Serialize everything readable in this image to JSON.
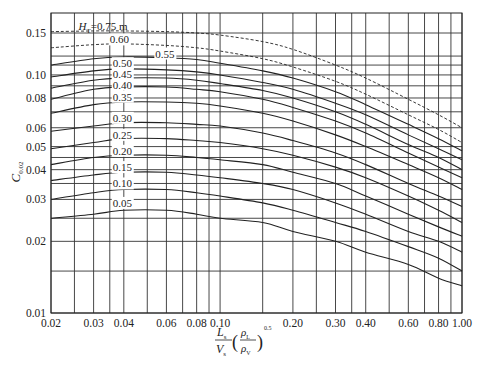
{
  "chart_data": {
    "type": "line",
    "title": "",
    "xlabel": "L_s/V_s (ρ_L/ρ_V)^0.5",
    "ylabel": "C_0.02",
    "xscale": "log",
    "yscale": "log",
    "xlim": [
      0.02,
      1.0
    ],
    "ylim": [
      0.01,
      0.18
    ],
    "grid": true,
    "x_tick_labels": [
      "0.02",
      "0.03",
      "0.04",
      "0.06",
      "0.08",
      "0.10",
      "0.20",
      "0.30",
      "0.40",
      "0.60",
      "0.80",
      "1.00"
    ],
    "x_ticks": [
      0.02,
      0.03,
      0.04,
      0.06,
      0.08,
      0.1,
      0.2,
      0.3,
      0.4,
      0.6,
      0.8,
      1.0
    ],
    "y_tick_labels": [
      "0.01",
      "0.02",
      "0.03",
      "0.04",
      "0.05",
      "0.06",
      "0.08",
      "0.10",
      "0.15"
    ],
    "y_ticks": [
      0.01,
      0.02,
      0.03,
      0.04,
      0.05,
      0.06,
      0.08,
      0.1,
      0.15
    ],
    "x_grid": [
      0.02,
      0.025,
      0.03,
      0.035,
      0.04,
      0.05,
      0.06,
      0.07,
      0.08,
      0.09,
      0.1,
      0.15,
      0.2,
      0.25,
      0.3,
      0.35,
      0.4,
      0.5,
      0.6,
      0.7,
      0.8,
      0.9,
      1.0
    ],
    "y_grid": [
      0.01,
      0.015,
      0.02,
      0.025,
      0.03,
      0.035,
      0.04,
      0.045,
      0.05,
      0.06,
      0.07,
      0.08,
      0.09,
      0.1,
      0.11,
      0.12,
      0.15
    ],
    "x": [
      0.02,
      0.03,
      0.04,
      0.06,
      0.08,
      0.1,
      0.15,
      0.2,
      0.3,
      0.4,
      0.6,
      0.8,
      1.0
    ],
    "series": [
      {
        "name": "H_T=0.75 m",
        "dashed": true,
        "values": [
          0.152,
          0.153,
          0.153,
          0.152,
          0.15,
          0.147,
          0.138,
          0.128,
          0.11,
          0.097,
          0.079,
          0.068,
          0.06
        ]
      },
      {
        "name": "0.60",
        "dashed": true,
        "values": [
          0.13,
          0.134,
          0.135,
          0.133,
          0.13,
          0.126,
          0.117,
          0.108,
          0.094,
          0.083,
          0.068,
          0.059,
          0.052
        ]
      },
      {
        "name": "0.55",
        "dashed": false,
        "values": [
          0.11,
          0.117,
          0.119,
          0.118,
          0.116,
          0.112,
          0.104,
          0.097,
          0.085,
          0.075,
          0.062,
          0.054,
          0.048
        ]
      },
      {
        "name": "0.50",
        "dashed": false,
        "values": [
          0.098,
          0.104,
          0.106,
          0.105,
          0.103,
          0.1,
          0.093,
          0.087,
          0.076,
          0.068,
          0.056,
          0.049,
          0.044
        ]
      },
      {
        "name": "0.45",
        "dashed": false,
        "values": [
          0.088,
          0.095,
          0.097,
          0.097,
          0.095,
          0.092,
          0.086,
          0.08,
          0.07,
          0.062,
          0.051,
          0.045,
          0.04
        ]
      },
      {
        "name": "0.40",
        "dashed": false,
        "values": [
          0.079,
          0.087,
          0.089,
          0.089,
          0.087,
          0.085,
          0.079,
          0.073,
          0.064,
          0.057,
          0.047,
          0.041,
          0.037
        ]
      },
      {
        "name": "0.35",
        "dashed": false,
        "values": [
          0.069,
          0.075,
          0.077,
          0.077,
          0.076,
          0.074,
          0.069,
          0.064,
          0.056,
          0.05,
          0.042,
          0.037,
          0.033
        ]
      },
      {
        "name": "0.30",
        "dashed": false,
        "values": [
          0.058,
          0.061,
          0.063,
          0.063,
          0.062,
          0.061,
          0.057,
          0.053,
          0.047,
          0.042,
          0.035,
          0.031,
          0.028
        ]
      },
      {
        "name": "0.25",
        "dashed": false,
        "values": [
          0.049,
          0.052,
          0.054,
          0.054,
          0.053,
          0.052,
          0.049,
          0.046,
          0.041,
          0.037,
          0.031,
          0.027,
          0.024
        ]
      },
      {
        "name": "0.20",
        "dashed": false,
        "values": [
          0.042,
          0.045,
          0.046,
          0.046,
          0.045,
          0.044,
          0.042,
          0.039,
          0.035,
          0.031,
          0.026,
          0.023,
          0.021
        ]
      },
      {
        "name": "0.15",
        "dashed": false,
        "values": [
          0.036,
          0.038,
          0.039,
          0.039,
          0.038,
          0.037,
          0.035,
          0.033,
          0.029,
          0.026,
          0.022,
          0.02,
          0.018
        ]
      },
      {
        "name": "0.10",
        "dashed": false,
        "values": [
          0.03,
          0.032,
          0.033,
          0.033,
          0.032,
          0.031,
          0.029,
          0.027,
          0.024,
          0.022,
          0.019,
          0.017,
          0.015
        ]
      },
      {
        "name": "0.05",
        "dashed": false,
        "values": [
          0.025,
          0.026,
          0.027,
          0.027,
          0.026,
          0.025,
          0.024,
          0.022,
          0.02,
          0.018,
          0.016,
          0.014,
          0.013
        ]
      }
    ],
    "curve_labels": [
      {
        "text": "H_T=0.75 m",
        "x": 0.026,
        "y": 0.16
      },
      {
        "text": "0.60",
        "x": 0.035,
        "y": 0.141
      },
      {
        "text": "0.55",
        "x": 0.054,
        "y": 0.123
      },
      {
        "text": "0.50",
        "x": 0.036,
        "y": 0.112
      },
      {
        "text": "0.45",
        "x": 0.036,
        "y": 0.101
      },
      {
        "text": "0.40",
        "x": 0.036,
        "y": 0.091
      },
      {
        "text": "0.35",
        "x": 0.036,
        "y": 0.081
      },
      {
        "text": "0.30",
        "x": 0.036,
        "y": 0.066
      },
      {
        "text": "0.25",
        "x": 0.036,
        "y": 0.056
      },
      {
        "text": "0.20",
        "x": 0.036,
        "y": 0.048
      },
      {
        "text": "0.15",
        "x": 0.036,
        "y": 0.041
      },
      {
        "text": "0.10",
        "x": 0.036,
        "y": 0.035
      },
      {
        "text": "0.05",
        "x": 0.036,
        "y": 0.029
      }
    ]
  },
  "labels": {
    "y_axis_main": "C",
    "y_axis_sub": "0.02",
    "x_axis_num_main": "L",
    "x_axis_num_sub": "s",
    "x_axis_den_main": "V",
    "x_axis_den_sub": "s",
    "rho_num": "ρ",
    "rho_num_sub": "L",
    "rho_den": "ρ",
    "rho_den_sub": "V",
    "exponent": "0.5",
    "legend_prefix": "H",
    "legend_prefix_sub": "T",
    "legend_value": "=0.75 m"
  }
}
